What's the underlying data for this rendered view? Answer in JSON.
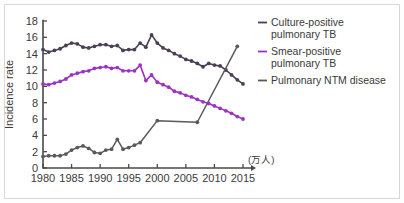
{
  "chart_data": {
    "type": "line",
    "title": "",
    "xlabel": "",
    "ylabel": "Incidence rate",
    "unit_label": "(万人)",
    "xlim": [
      1980,
      2015
    ],
    "ylim": [
      0,
      18
    ],
    "grid": false,
    "legend_position": "right",
    "x_ticks": [
      "1980",
      "1985",
      "1990",
      "1995",
      "2000",
      "2005",
      "2010",
      "2015"
    ],
    "x_tick_values": [
      1980,
      1985,
      1990,
      1995,
      2000,
      2005,
      2010,
      2015
    ],
    "y_ticks": [
      "0",
      "2",
      "4",
      "6",
      "8",
      "10",
      "12",
      "14",
      "16",
      "18"
    ],
    "y_tick_values": [
      0,
      2,
      4,
      6,
      8,
      10,
      12,
      14,
      16,
      18
    ],
    "series": [
      {
        "name": "Culture-positive pulmonary TB",
        "color": "#4a4055",
        "marker": "circle",
        "x": [
          1980,
          1981,
          1982,
          1983,
          1984,
          1985,
          1986,
          1987,
          1988,
          1989,
          1990,
          1991,
          1992,
          1993,
          1994,
          1995,
          1996,
          1997,
          1998,
          1999,
          2000,
          2001,
          2002,
          2003,
          2004,
          2005,
          2006,
          2007,
          2008,
          2009,
          2010,
          2011,
          2012,
          2013,
          2014,
          2015
        ],
        "values": [
          14.5,
          14.2,
          14.4,
          14.6,
          15.0,
          15.3,
          15.2,
          14.8,
          14.7,
          14.9,
          15.1,
          15.1,
          14.9,
          15.0,
          14.4,
          14.5,
          14.5,
          15.3,
          14.8,
          16.3,
          15.3,
          14.7,
          14.4,
          14.0,
          13.7,
          13.3,
          13.1,
          12.8,
          12.4,
          12.8,
          12.6,
          12.5,
          12.0,
          11.4,
          10.8,
          10.3
        ]
      },
      {
        "name": "Smear-positive pulmonary TB",
        "color": "#9b34c4",
        "marker": "circle",
        "x": [
          1980,
          1981,
          1982,
          1983,
          1984,
          1985,
          1986,
          1987,
          1988,
          1989,
          1990,
          1991,
          1992,
          1993,
          1994,
          1995,
          1996,
          1997,
          1998,
          1999,
          2000,
          2001,
          2002,
          2003,
          2004,
          2005,
          2006,
          2007,
          2008,
          2009,
          2010,
          2011,
          2012,
          2013,
          2014,
          2015
        ],
        "values": [
          10.3,
          10.2,
          10.4,
          10.6,
          10.9,
          11.4,
          11.6,
          11.8,
          11.9,
          12.2,
          12.3,
          12.4,
          12.2,
          12.3,
          11.9,
          11.9,
          11.9,
          12.6,
          10.7,
          11.4,
          10.5,
          10.2,
          9.9,
          9.4,
          9.2,
          8.9,
          8.7,
          8.4,
          8.1,
          7.9,
          7.6,
          7.3,
          7.0,
          6.7,
          6.3,
          6.0
        ]
      },
      {
        "name": "Pulmonary NTM disease",
        "color": "#5a5a5a",
        "marker": "circle",
        "x": [
          1980,
          1981,
          1982,
          1983,
          1984,
          1985,
          1986,
          1987,
          1988,
          1989,
          1990,
          1991,
          1992,
          1993,
          1994,
          1995,
          1996,
          1997,
          2000,
          2007,
          2014
        ],
        "values": [
          1.4,
          1.5,
          1.5,
          1.5,
          1.7,
          2.2,
          2.5,
          2.7,
          2.4,
          1.9,
          1.8,
          2.2,
          2.3,
          3.5,
          2.3,
          2.5,
          2.8,
          3.1,
          5.8,
          5.6,
          14.9
        ]
      }
    ]
  },
  "legend": {
    "items": [
      {
        "label_line1": "Culture-positive",
        "label_line2": "pulmonary TB",
        "color": "#4a4055"
      },
      {
        "label_line1": "Smear-positive",
        "label_line2": "pulmonary TB",
        "color": "#9b34c4"
      },
      {
        "label_line1": "Pulmonary NTM disease",
        "label_line2": "",
        "color": "#5a5a5a"
      }
    ]
  },
  "axes": {
    "y_title": "Incidence rate",
    "unit": "(万人)"
  }
}
